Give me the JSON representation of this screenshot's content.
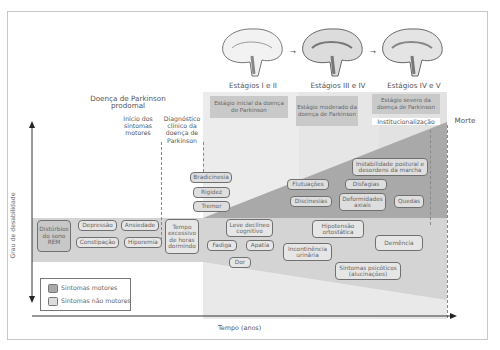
{
  "stages": [
    {
      "title": "Estágios I e II",
      "label": "Estágio inicial da doença de Parkinson"
    },
    {
      "title": "Estágios III e IV",
      "label": "Estágio moderado da doença de Parkinson"
    },
    {
      "title": "Estágios IV e V",
      "label": "Estágio severo da doença de Parkinson"
    }
  ],
  "brain_icons": [
    "brain-stage-early-icon",
    "brain-stage-moderate-icon",
    "brain-stage-severe-icon"
  ],
  "prodromal": {
    "title": "Doença de Parkinson prodomal"
  },
  "milestones": {
    "motor_onset": "Início dos sintomas motores",
    "diagnosis": "Diagnóstico clínico da doença de Parkinson",
    "institutionalization": "Institucionalização",
    "death": "Morte"
  },
  "axes": {
    "y_label": "Grau de desabilidade",
    "x_label": "Tempo (anos)"
  },
  "motor_symptoms": [
    "Bradicinesia",
    "Rigidez",
    "Tremor",
    "Flutuações",
    "Discinesias",
    "Disfagias",
    "Deformidades axiais",
    "Instabilidade postural e desordens da marcha",
    "Quedas"
  ],
  "non_motor_symptoms": [
    "Distúrbios do sono REM",
    "Depressão",
    "Ansiedade",
    "Constipação",
    "Hiporemia",
    "Tempo excessivo de horas dormindo",
    "Leve declíneo cognitivo",
    "Fadiga",
    "Apatia",
    "Dor",
    "Hipotensão ortostática",
    "Incontinência urinária",
    "Demência",
    "Sintomas psicóticos (alucinações)"
  ],
  "legend": {
    "motor": "Sintomas motores",
    "non_motor": "Sintomas não motores"
  },
  "colors": {
    "motor_fill": "#a9a9a9",
    "non_motor_fill": "#d3d3d3",
    "stage_label_bg": "#c9c9c9"
  }
}
